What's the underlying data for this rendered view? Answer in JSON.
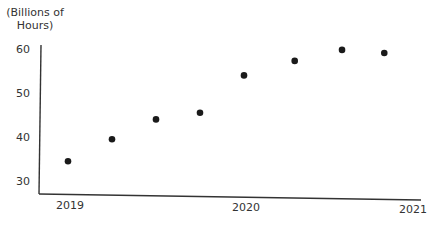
{
  "chart_data": {
    "type": "scatter",
    "title": "",
    "xlabel": "",
    "ylabel": "(Billions of Hours)",
    "ylabel_lines": [
      "(Billions of",
      "Hours)"
    ],
    "x_ticks": [
      "2019",
      "2020",
      "2021"
    ],
    "y_ticks": [
      30,
      40,
      50,
      60
    ],
    "ylim": [
      27,
      60
    ],
    "xlim": [
      2018.9,
      2021
    ],
    "grid": false,
    "legend": null,
    "series": [
      {
        "name": "Hours",
        "color": "#1a1a1a",
        "points": [
          {
            "x": 2019.0,
            "y": 34.5
          },
          {
            "x": 2019.25,
            "y": 39.5
          },
          {
            "x": 2019.5,
            "y": 44.0
          },
          {
            "x": 2019.75,
            "y": 45.5
          },
          {
            "x": 2020.0,
            "y": 54.0
          },
          {
            "x": 2020.3,
            "y": 57.3
          },
          {
            "x": 2020.58,
            "y": 59.8
          },
          {
            "x": 2020.83,
            "y": 59.1
          }
        ]
      }
    ]
  }
}
